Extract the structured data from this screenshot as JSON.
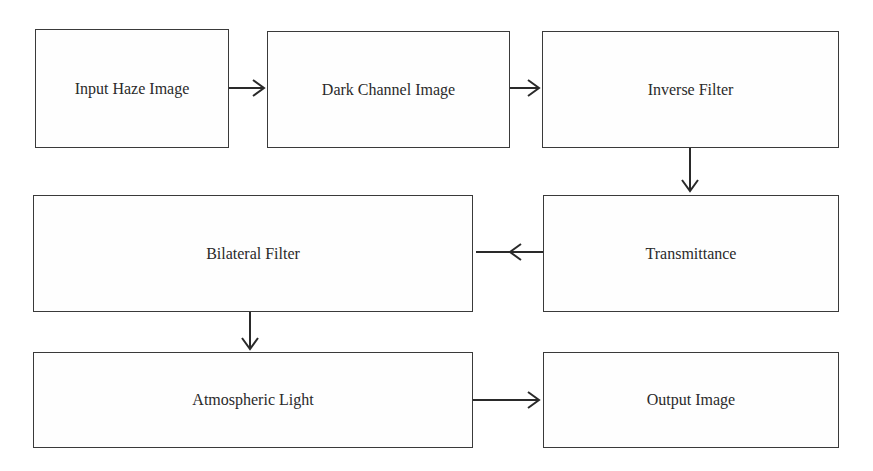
{
  "diagram": {
    "title": "",
    "nodes": [
      {
        "id": "input",
        "label": "Input Haze Image"
      },
      {
        "id": "dark",
        "label": "Dark Channel Image"
      },
      {
        "id": "inverse",
        "label": "Inverse Filter"
      },
      {
        "id": "transmittance",
        "label": "Transmittance"
      },
      {
        "id": "bilateral",
        "label": "Bilateral Filter"
      },
      {
        "id": "atmospheric",
        "label": "Atmospheric Light"
      },
      {
        "id": "output",
        "label": "Output Image"
      }
    ],
    "edges": [
      {
        "from": "input",
        "to": "dark"
      },
      {
        "from": "dark",
        "to": "inverse"
      },
      {
        "from": "inverse",
        "to": "transmittance"
      },
      {
        "from": "transmittance",
        "to": "bilateral"
      },
      {
        "from": "bilateral",
        "to": "atmospheric"
      },
      {
        "from": "atmospheric",
        "to": "output"
      }
    ]
  }
}
